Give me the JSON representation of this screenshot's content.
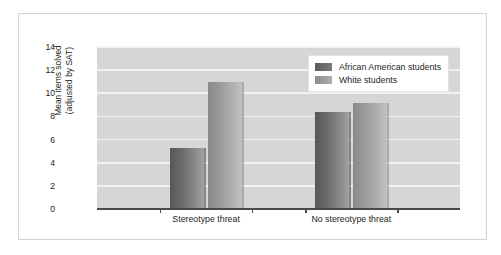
{
  "chart_data": {
    "type": "bar",
    "title": "",
    "xlabel": "",
    "ylabel": "Mean items solved (adjusted by SAT)",
    "ylabel_line1": "Mean items solved",
    "ylabel_line2": "(adjusted by SAT)",
    "categories": [
      "Stereotype threat",
      "No stereotype threat"
    ],
    "series": [
      {
        "name": "African American students",
        "values": [
          5.3,
          8.4
        ],
        "color": "#6a6a6a"
      },
      {
        "name": "White students",
        "values": [
          11.0,
          9.2
        ],
        "color": "#a0a0a0"
      }
    ],
    "ylim": [
      0,
      14
    ],
    "yticks": [
      14,
      12,
      10,
      8,
      6,
      4,
      2,
      0
    ],
    "ytick_labels": [
      "14",
      "12",
      "10",
      "8",
      "6",
      "4",
      "2",
      "0"
    ],
    "grid": true,
    "grid_color": "#f2f2f2",
    "plot_background": "#d6d6d6",
    "legend_position": "top-right"
  },
  "figure": {
    "background": "#ffffff",
    "border_color": "#d2d4d6"
  },
  "legend": {
    "entries": [
      {
        "label": "African American students"
      },
      {
        "label": "White students"
      }
    ]
  }
}
